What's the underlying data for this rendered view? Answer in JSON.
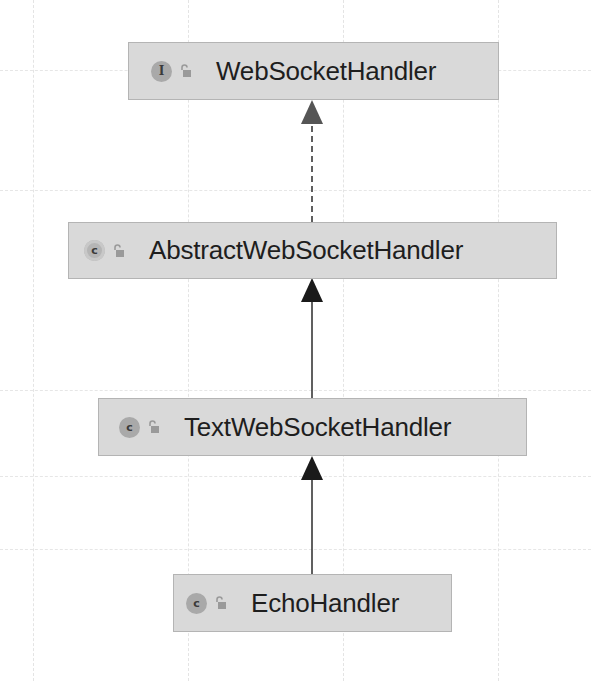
{
  "diagram": {
    "type": "uml-class-hierarchy",
    "nodes": [
      {
        "id": "n1",
        "name": "WebSocketHandler",
        "kind": "interface",
        "kind_glyph": "I",
        "icon": "interface-icon",
        "visibility_icon": "unlocked-icon"
      },
      {
        "id": "n2",
        "name": "AbstractWebSocketHandler",
        "kind": "abstract-class",
        "kind_glyph": "c",
        "icon": "abstract-class-icon",
        "visibility_icon": "unlocked-icon"
      },
      {
        "id": "n3",
        "name": "TextWebSocketHandler",
        "kind": "class",
        "kind_glyph": "c",
        "icon": "class-icon",
        "visibility_icon": "unlocked-icon"
      },
      {
        "id": "n4",
        "name": "EchoHandler",
        "kind": "class",
        "kind_glyph": "c",
        "icon": "class-icon",
        "visibility_icon": "unlocked-icon"
      }
    ],
    "edges": [
      {
        "from": "AbstractWebSocketHandler",
        "to": "WebSocketHandler",
        "type": "implements",
        "style": "dashed"
      },
      {
        "from": "TextWebSocketHandler",
        "to": "AbstractWebSocketHandler",
        "type": "extends",
        "style": "solid"
      },
      {
        "from": "EchoHandler",
        "to": "TextWebSocketHandler",
        "type": "extends",
        "style": "solid"
      }
    ],
    "colors": {
      "node_fill": "#d9d9d9",
      "node_border": "#b4b4b4",
      "edge": "#2b2b2b",
      "implements_arrowhead": "#555555",
      "grid": "#e4e4e4"
    }
  }
}
